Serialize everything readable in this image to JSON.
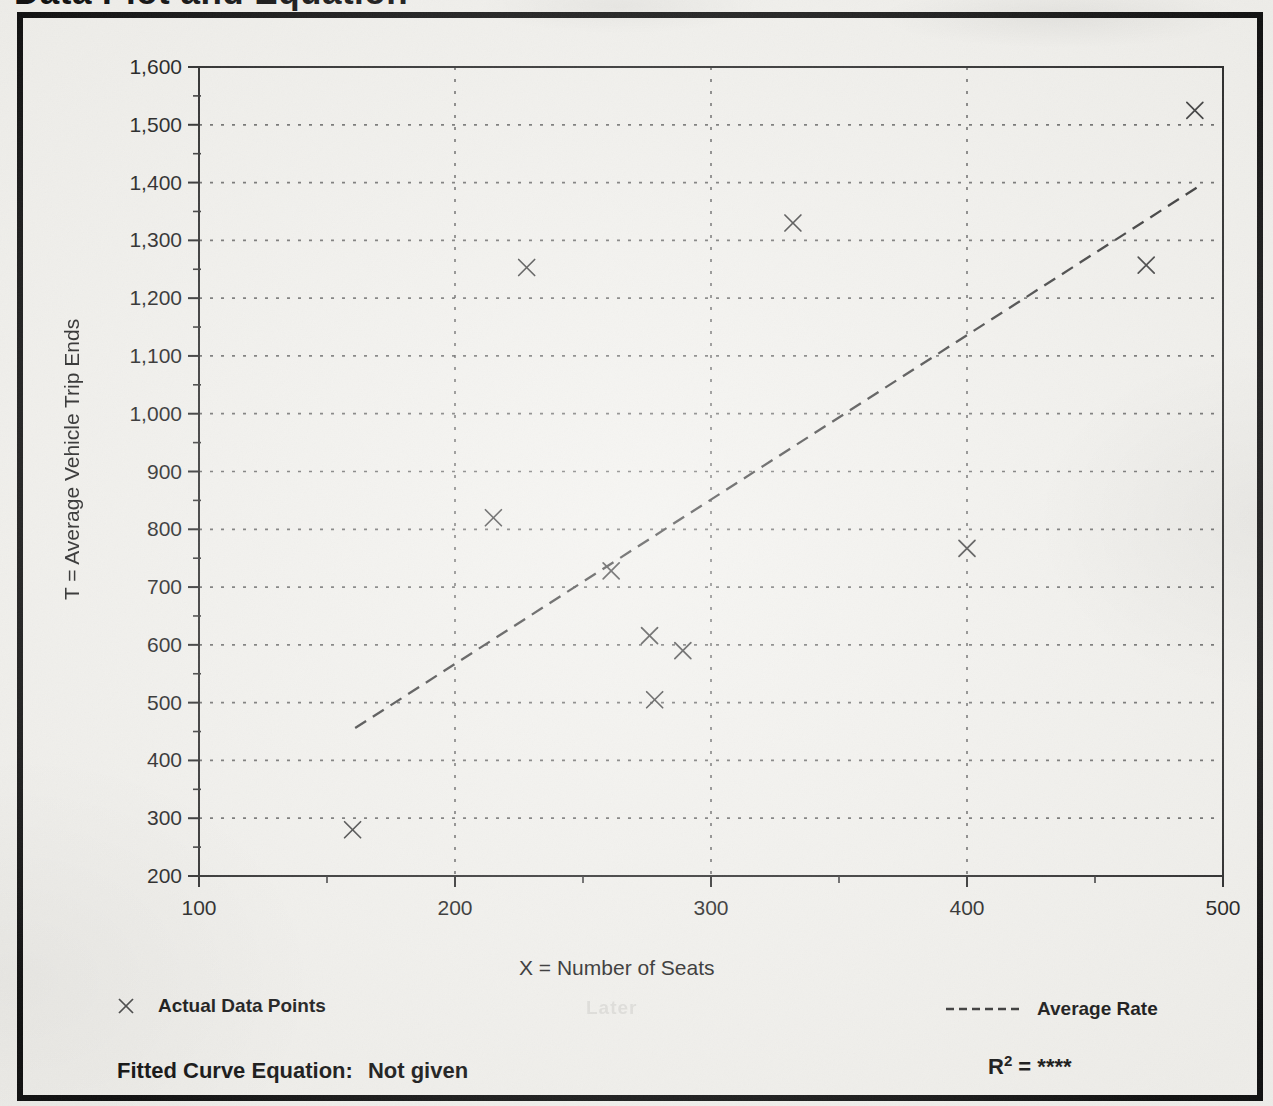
{
  "page": {
    "title": "Data Plot and Equation",
    "ghost_text": "Later"
  },
  "chart_data": {
    "type": "scatter",
    "title": "Data Plot and Equation",
    "xlabel": "X = Number of Seats",
    "ylabel": "T = Average Vehicle Trip Ends",
    "xlim": [
      100,
      500
    ],
    "ylim": [
      200,
      1600
    ],
    "x_ticks": [
      100,
      200,
      300,
      400,
      500
    ],
    "x_tick_labels": [
      "100",
      "200",
      "300",
      "400",
      "500"
    ],
    "y_ticks": [
      200,
      300,
      400,
      500,
      600,
      700,
      800,
      900,
      1000,
      1100,
      1200,
      1300,
      1400,
      1500,
      1600
    ],
    "y_tick_labels": [
      "200",
      "300",
      "400",
      "500",
      "600",
      "700",
      "800",
      "900",
      "1,000",
      "1,100",
      "1,200",
      "1,300",
      "1,400",
      "1,500",
      "1,600"
    ],
    "minor_tick_step": 50,
    "grid": "dotted-at-major-ticks",
    "legend_position": "below",
    "series": [
      {
        "name": "Actual Data Points",
        "type": "scatter",
        "marker": "x",
        "points": [
          [
            160,
            280
          ],
          [
            215,
            820
          ],
          [
            228,
            1253
          ],
          [
            261,
            728
          ],
          [
            276,
            616
          ],
          [
            278,
            505
          ],
          [
            289,
            590
          ],
          [
            332,
            1330
          ],
          [
            400,
            767
          ],
          [
            470,
            1257
          ],
          [
            489,
            1525
          ]
        ]
      },
      {
        "name": "Average Rate",
        "type": "line",
        "style": "dashed",
        "points": [
          [
            161,
            456
          ],
          [
            490,
            1392
          ]
        ]
      }
    ]
  },
  "legend": {
    "actual_label": "Actual Data Points",
    "rate_label": "Average Rate",
    "actual_icon": "x-cross-marker",
    "rate_icon": "dashed-line-sample"
  },
  "footer": {
    "equation_label": "Fitted Curve Equation:",
    "equation_value": "Not given",
    "r_base": "R",
    "r_exp": "2",
    "r_rest": "= ****"
  },
  "colors": {
    "paper": "#f2f1ed",
    "ink": "#1f1f1f",
    "frame": "#101010",
    "grid_dot": "#4a4a4a",
    "marker": "#3d3d3d",
    "trend_line": "#383838"
  }
}
